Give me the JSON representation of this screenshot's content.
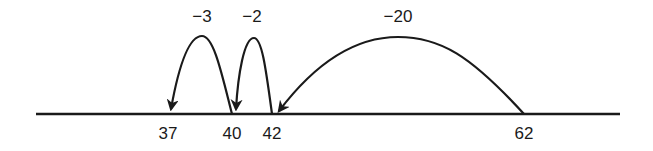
{
  "diagram": {
    "type": "number-line",
    "colors": {
      "stroke": "#1a1a1a",
      "background": "#ffffff"
    },
    "ticks": [
      {
        "value": "37",
        "x": 168
      },
      {
        "value": "40",
        "x": 232
      },
      {
        "value": "42",
        "x": 272
      },
      {
        "value": "62",
        "x": 524
      }
    ],
    "jumps": [
      {
        "label": "−20",
        "from": "62",
        "to": "42",
        "label_x": 398
      },
      {
        "label": "−2",
        "from": "42",
        "to": "40",
        "label_x": 252
      },
      {
        "label": "−3",
        "from": "40",
        "to": "37",
        "label_x": 202
      }
    ]
  }
}
